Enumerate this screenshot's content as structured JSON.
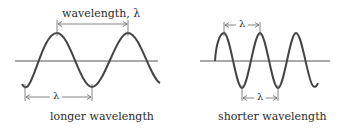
{
  "colors": {
    "wave": "#444444",
    "axis": "#555555",
    "text": "#2a2a2a",
    "background": "#ffffff"
  },
  "left_panel": {
    "top_label": "wavelength, λ",
    "bottom_label": "λ",
    "caption": "longer wavelength"
  },
  "right_panel": {
    "top_label": "λ",
    "bottom_label": "λ",
    "caption": "shorter wavelength"
  }
}
